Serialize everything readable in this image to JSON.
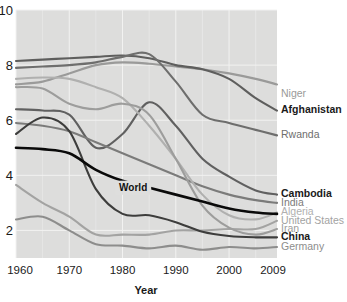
{
  "chart_data": {
    "type": "line",
    "title": "",
    "xlabel": "Year",
    "ylabel": "",
    "xlim": [
      1960,
      2009
    ],
    "ylim": [
      1.0,
      10.0
    ],
    "grid": true,
    "legend_position": "right-edge-labels",
    "xticks": [
      "1960",
      "1970",
      "1980",
      "1990",
      "2000",
      "2009"
    ],
    "xtick_values": [
      1960,
      1970,
      1980,
      1990,
      2000,
      2009
    ],
    "yticks": [
      "10",
      "8",
      "6",
      "4",
      "2"
    ],
    "ytick_values": [
      10,
      8,
      6,
      4,
      2
    ],
    "annotations": [
      {
        "text": "World",
        "x": 1982,
        "y": 3.55
      }
    ],
    "x": [
      1960,
      1965,
      1970,
      1975,
      1980,
      1985,
      1990,
      1995,
      2000,
      2005,
      2009
    ],
    "series": [
      {
        "name": "Niger",
        "label": "Niger",
        "color": "#9a9a99",
        "bold": false,
        "label_y": 6.95,
        "values": [
          7.3,
          7.4,
          7.7,
          8.0,
          8.1,
          8.05,
          7.95,
          7.85,
          7.7,
          7.5,
          7.3
        ]
      },
      {
        "name": "Afghanistan",
        "label": "Afghanistan",
        "color": "#5e5e5d",
        "bold": true,
        "label_y": 6.35,
        "values": [
          8.15,
          8.2,
          8.25,
          8.3,
          8.35,
          8.25,
          8.0,
          7.85,
          7.5,
          6.8,
          6.35
        ]
      },
      {
        "name": "Rwanda",
        "label": "Rwanda",
        "color": "#6e6e6d",
        "bold": false,
        "label_y": 5.45,
        "values": [
          7.9,
          7.95,
          8.0,
          8.1,
          8.3,
          8.4,
          7.4,
          6.2,
          5.9,
          5.65,
          5.45
        ]
      },
      {
        "name": "Cambodia",
        "label": "Cambodia",
        "color": "#606060",
        "bold": true,
        "label_y": 3.3,
        "values": [
          6.4,
          6.35,
          6.2,
          5.0,
          5.5,
          6.65,
          5.8,
          4.6,
          3.95,
          3.45,
          3.3
        ]
      },
      {
        "name": "India",
        "label": "India",
        "color": "#7b7b7a",
        "bold": false,
        "label_y": 3.0,
        "values": [
          5.9,
          5.8,
          5.6,
          5.2,
          4.8,
          4.4,
          4.0,
          3.6,
          3.3,
          3.1,
          3.0
        ]
      },
      {
        "name": "Algeria",
        "label": "Algeria",
        "color": "#b0b0af",
        "bold": false,
        "label_y": 2.65,
        "values": [
          7.5,
          7.55,
          7.5,
          7.2,
          6.8,
          5.8,
          4.6,
          3.3,
          2.55,
          2.4,
          2.65
        ]
      },
      {
        "name": "United States",
        "label": "United States",
        "color": "#a3a3a2",
        "bold": false,
        "label_y": 2.35,
        "values": [
          3.65,
          3.0,
          2.5,
          1.85,
          1.85,
          1.85,
          2.0,
          2.0,
          2.05,
          2.05,
          2.35
        ]
      },
      {
        "name": "Iran",
        "label": "Iran",
        "color": "#9d9d9c",
        "bold": false,
        "label_y": 2.05,
        "values": [
          7.2,
          7.15,
          6.6,
          6.4,
          6.6,
          6.2,
          4.6,
          2.9,
          2.1,
          1.85,
          2.05
        ]
      },
      {
        "name": "China",
        "label": "China",
        "color": "#3d3d3c",
        "bold": true,
        "label_y": 1.75,
        "values": [
          5.5,
          6.1,
          5.6,
          3.5,
          2.6,
          2.55,
          2.3,
          1.95,
          1.8,
          1.75,
          1.75
        ]
      },
      {
        "name": "Germany",
        "label": "Germany",
        "color": "#8d8d8c",
        "bold": false,
        "label_y": 1.4,
        "values": [
          2.4,
          2.5,
          2.0,
          1.5,
          1.45,
          1.35,
          1.45,
          1.3,
          1.4,
          1.35,
          1.4
        ]
      },
      {
        "name": "World",
        "label": "",
        "color": "#0a0a0a",
        "bold": true,
        "label_y": null,
        "values": [
          5.0,
          4.95,
          4.8,
          4.2,
          3.8,
          3.55,
          3.3,
          3.05,
          2.8,
          2.65,
          2.6
        ]
      }
    ]
  }
}
